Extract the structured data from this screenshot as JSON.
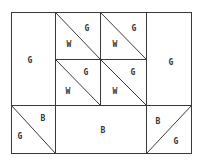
{
  "diagram": {
    "type": "quilt-block",
    "colors": {
      "line": "#3a3a3a",
      "label": "#333333",
      "background": "#ffffff"
    },
    "pieces": [
      {
        "id": "left-rect",
        "labels": [
          {
            "text": "G",
            "x": 30,
            "y": 60
          }
        ]
      },
      {
        "id": "right-rect",
        "labels": [
          {
            "text": "G",
            "x": 171,
            "y": 62
          }
        ]
      },
      {
        "id": "hst-top-left",
        "labels": [
          {
            "text": "G",
            "x": 87,
            "y": 28
          },
          {
            "text": "W",
            "x": 69,
            "y": 44
          }
        ]
      },
      {
        "id": "hst-top-right",
        "labels": [
          {
            "text": "G",
            "x": 134,
            "y": 28
          },
          {
            "text": "W",
            "x": 115,
            "y": 44
          }
        ]
      },
      {
        "id": "hst-mid-left",
        "labels": [
          {
            "text": "G",
            "x": 86,
            "y": 72
          },
          {
            "text": "W",
            "x": 68,
            "y": 91
          }
        ]
      },
      {
        "id": "hst-mid-right",
        "labels": [
          {
            "text": "G",
            "x": 133,
            "y": 72
          },
          {
            "text": "W",
            "x": 115,
            "y": 91
          }
        ]
      },
      {
        "id": "hst-bottom-left",
        "labels": [
          {
            "text": "B",
            "x": 43,
            "y": 118
          },
          {
            "text": "G",
            "x": 20,
            "y": 136
          }
        ]
      },
      {
        "id": "bottom-center-rect",
        "labels": [
          {
            "text": "B",
            "x": 103,
            "y": 130
          }
        ]
      },
      {
        "id": "hst-bottom-right",
        "labels": [
          {
            "text": "B",
            "x": 158,
            "y": 121
          },
          {
            "text": "G",
            "x": 176,
            "y": 141
          }
        ]
      }
    ]
  }
}
